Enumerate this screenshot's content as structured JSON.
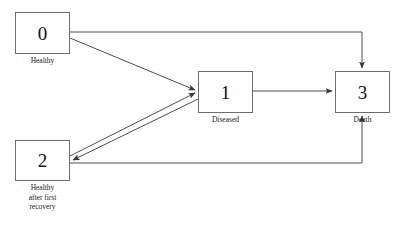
{
  "diagram": {
    "type": "state-transition-diagram",
    "background_color": "#ffffff",
    "stroke_color": "#6e6e6e",
    "edge_color": "#3a3a3a",
    "text_color": "#1a1a1a",
    "canvas": {
      "width": 401,
      "height": 225
    },
    "nodes": [
      {
        "key": "state-0",
        "id": "0",
        "label": "Healthy",
        "x": 15,
        "y": 12,
        "w": 55,
        "h": 42,
        "label_top": 56
      },
      {
        "key": "state-1",
        "id": "1",
        "label": "Diseased",
        "x": 198,
        "y": 71,
        "w": 55,
        "h": 42,
        "label_top": 115
      },
      {
        "key": "state-2",
        "id": "2",
        "label": "Healthy\nafter first\nrecovery",
        "x": 15,
        "y": 140,
        "w": 55,
        "h": 41,
        "label_top": 183
      },
      {
        "key": "state-3",
        "id": "3",
        "label": "Death",
        "x": 335,
        "y": 71,
        "w": 55,
        "h": 42,
        "label_top": 115
      }
    ],
    "edges": [
      {
        "key": "edge-0-to-3",
        "from": "0",
        "to": "3",
        "shape": "elbow",
        "path": "M 70 32 L 362 32 L 362 68"
      },
      {
        "key": "edge-0-to-1",
        "from": "0",
        "to": "1",
        "shape": "diagonal",
        "path": "M 70 38 L 195 90"
      },
      {
        "key": "edge-2-to-1",
        "from": "2",
        "to": "1",
        "shape": "diagonal",
        "path": "M 70 156 L 195 93"
      },
      {
        "key": "edge-1-to-2",
        "from": "1",
        "to": "2",
        "shape": "diagonal",
        "path": "M 198 99 L 73 160"
      },
      {
        "key": "edge-1-to-3",
        "from": "1",
        "to": "3",
        "shape": "straight",
        "path": "M 253 91 L 332 91"
      },
      {
        "key": "edge-2-to-3",
        "from": "2",
        "to": "3",
        "shape": "elbow",
        "path": "M 70 163 L 362 163 L 362 116"
      }
    ]
  }
}
